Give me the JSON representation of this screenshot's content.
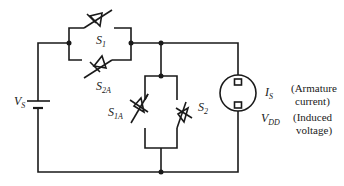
{
  "diagram": {
    "type": "circuit-schematic",
    "colors": {
      "line": "#1a1a1a",
      "background": "#ffffff"
    },
    "source": {
      "name": "V",
      "sub": "S"
    },
    "switches": [
      {
        "id": "S1",
        "name": "S",
        "sub": "1"
      },
      {
        "id": "S2A",
        "name": "S",
        "sub": "2A"
      },
      {
        "id": "S1A",
        "name": "S",
        "sub": "1A"
      },
      {
        "id": "S2",
        "name": "S",
        "sub": "2"
      }
    ],
    "motor": {
      "current_label": {
        "name": "I",
        "sub": "S"
      },
      "voltage_label": {
        "name": "V",
        "sub": "DD"
      },
      "current_note": [
        "(Armature",
        "current)"
      ],
      "voltage_note": [
        "(Induced",
        "voltage)"
      ]
    }
  }
}
